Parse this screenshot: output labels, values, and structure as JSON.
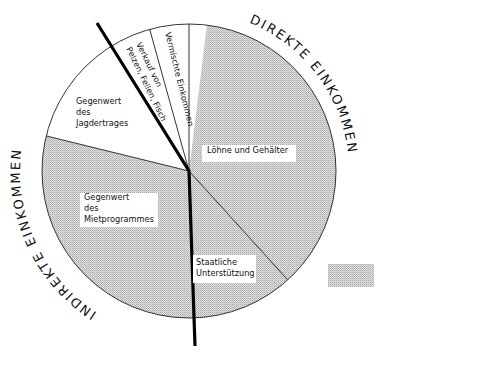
{
  "chart_data": {
    "type": "pie",
    "title": "",
    "center": [
      189,
      171
    ],
    "radius": 147,
    "start_angle_deg": 0,
    "direction": "clockwise",
    "segments": [
      {
        "label": "Löhne und Gehälter",
        "lines": [
          "Löhne  und  Gehälter"
        ],
        "start": 0,
        "end": 137.8,
        "percent": 38.3,
        "shaded": true,
        "shade_start": 7,
        "label_pos": [
          207,
          153
        ],
        "label_box": [
          202,
          145,
          94,
          17
        ],
        "rotate": 0
      },
      {
        "label": "Staatliche Unterstützung",
        "lines": [
          "Staatliche",
          "Unterstützung"
        ],
        "start": 137.8,
        "end": 180,
        "percent": 11.7,
        "shaded": true,
        "label_pos": [
          196,
          265
        ],
        "label_box": [
          193,
          255,
          63,
          28
        ],
        "rotate": 0
      },
      {
        "label": "Gegenwert des Mietprogrammes",
        "lines": [
          "Gegenwert",
          "des",
          "Mietprogrammes"
        ],
        "start": 180,
        "end": 283.8,
        "percent": 28.8,
        "shaded": true,
        "label_pos": [
          84,
          200
        ],
        "label_box": [
          80,
          193,
          78,
          34
        ],
        "rotate": 0
      },
      {
        "label": "Gegenwert des Jagdertrages",
        "lines": [
          "Gegenwert",
          "des",
          "Jagdertrages"
        ],
        "start": 283.8,
        "end": 328.7,
        "percent": 12.5,
        "shaded": false,
        "label_pos": [
          76,
          104
        ],
        "rotate": 0
      },
      {
        "label": "Verkauf von Pelzen, Fellen, Fisch",
        "lines": [
          "Verkauf   von",
          "Pelzen, Fellen, Fisch"
        ],
        "start": 328.7,
        "end": 344.5,
        "percent": 4.4,
        "shaded": false,
        "label_pos": [
          136,
          44
        ],
        "rotate": 64
      },
      {
        "label": "Vermischte Einkommen",
        "lines": [
          "Vermischte  Einkommen"
        ],
        "start": 344.5,
        "end": 360,
        "percent": 4.3,
        "shaded": false,
        "label_pos": [
          165,
          33
        ],
        "rotate": 76
      }
    ],
    "divider_thick": {
      "from": [
        97,
        23
      ],
      "to": [
        195,
        346
      ],
      "width": 3.2
    },
    "arc_labels": [
      {
        "text": "DIREKTE   EINKOMMEN",
        "radius": 160,
        "start": 22,
        "end": 92,
        "direction": "clockwise"
      },
      {
        "text": "INDIREKTE   EINKOMMEN",
        "radius": 160,
        "start": 213,
        "end": 290,
        "direction": "counterclockwise"
      }
    ],
    "legend": {
      "position": "right",
      "swatch": [
        328,
        264,
        46,
        23
      ],
      "lines": [
        "Einkommen aus",
        "staatlichen Quellen"
      ],
      "text_pos": [
        382,
        273
      ]
    },
    "colors": {
      "shade": "#d4d4d4",
      "shade_dot": "#9a9a9a",
      "outline": "#333333",
      "thick_line": "#000000"
    }
  },
  "legend": {
    "label": "Einkommen aus staatlichen Quellen"
  },
  "groups": {
    "direct": "DIREKTE EINKOMMEN",
    "indirect": "INDIREKTE EINKOMMEN"
  }
}
